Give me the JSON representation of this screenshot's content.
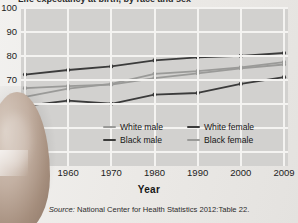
{
  "figure": {
    "title_cropped": "Life expectancy at birth, by race and sex",
    "x_axis_title": "Year",
    "source_prefix": "Source:",
    "source_text": " National Center for Health Statistics 2012:Table 22."
  },
  "legend": {
    "items": [
      {
        "label": "White male",
        "color": "#9a9a98",
        "name": "white-male"
      },
      {
        "label": "White female",
        "color": "#3b3b3b",
        "name": "white-female"
      },
      {
        "label": "Black male",
        "color": "#3b3b3b",
        "name": "black-male"
      },
      {
        "label": "Black female",
        "color": "#9a9a98",
        "name": "black-female"
      }
    ]
  },
  "chart_data": {
    "type": "line",
    "title": "Life expectancy at birth, by race and sex",
    "xlabel": "Year",
    "ylabel": "",
    "x": [
      1950,
      1960,
      1970,
      1980,
      1990,
      2000,
      2009
    ],
    "categories": [
      "1950",
      "1960",
      "1970",
      "1980",
      "1990",
      "2000",
      "2009"
    ],
    "yticks": [
      0,
      40,
      50,
      60,
      70,
      80,
      90,
      100
    ],
    "ylim": [
      40,
      100
    ],
    "y_axis_break": true,
    "grid": true,
    "legend_position": "inside-bottom-center",
    "series": [
      {
        "name": "White male",
        "color": "#9a9a98",
        "values": [
          66.5,
          67.4,
          68.0,
          70.7,
          72.7,
          74.8,
          76.4
        ]
      },
      {
        "name": "White female",
        "color": "#3b3b3b",
        "values": [
          72.2,
          74.1,
          75.6,
          78.1,
          79.4,
          80.0,
          81.2
        ]
      },
      {
        "name": "Black male",
        "color": "#3b3b3b",
        "values": [
          59.1,
          61.3,
          60.0,
          63.8,
          64.5,
          68.3,
          71.1
        ]
      },
      {
        "name": "Black female",
        "color": "#9a9a98",
        "values": [
          62.9,
          66.3,
          68.3,
          72.5,
          73.6,
          75.2,
          77.4
        ]
      }
    ]
  },
  "yaxis": {
    "ticks": [
      {
        "label": "100",
        "value": 100
      },
      {
        "label": "90",
        "value": 90
      },
      {
        "label": "80",
        "value": 80
      },
      {
        "label": "70",
        "value": 70
      },
      {
        "label": "60",
        "value": 60
      },
      {
        "label": "50",
        "value": 50
      },
      {
        "label": "40",
        "value": 40
      },
      {
        "label": "0",
        "value": 34
      }
    ]
  },
  "colors": {
    "plot_background": "#d2d1cf",
    "gridline": "#f4f3f1",
    "dark_series": "#3b3b3b",
    "light_series": "#9a9a98",
    "page_background": "#edecea"
  }
}
